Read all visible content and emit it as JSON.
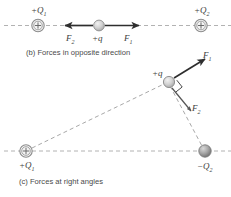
{
  "figure": {
    "panels": [
      {
        "id": "panel-b",
        "caption": "(b) Forces in opposite direction",
        "charges": [
          {
            "name": "charge-q1-top",
            "label": "+Q",
            "sub": "1",
            "kind": "positive-ring"
          },
          {
            "name": "charge-q-test-top",
            "label": "+q",
            "sub": "",
            "kind": "neutral-sphere"
          },
          {
            "name": "charge-q2-top",
            "label": "+Q",
            "sub": "2",
            "kind": "positive-ring"
          }
        ],
        "forces": [
          {
            "name": "force-f2-top",
            "label": "F",
            "sub": "2",
            "direction": "left"
          },
          {
            "name": "force-f1-top",
            "label": "F",
            "sub": "1",
            "direction": "right"
          }
        ]
      },
      {
        "id": "panel-c",
        "caption": "(c) Forces at right angles",
        "charges": [
          {
            "name": "charge-q1-bottom",
            "label": "+Q",
            "sub": "1",
            "kind": "positive-ring"
          },
          {
            "name": "charge-q-test-bottom",
            "label": "+q",
            "sub": "",
            "kind": "neutral-sphere"
          },
          {
            "name": "charge-q2-bottom",
            "label": "−Q",
            "sub": "2",
            "kind": "negative-sphere"
          }
        ],
        "forces": [
          {
            "name": "force-f1-bottom",
            "label": "F",
            "sub": "1",
            "direction": "up-right"
          },
          {
            "name": "force-f2-bottom",
            "label": "F",
            "sub": "2",
            "direction": "down-right"
          }
        ],
        "annotations": [
          {
            "name": "right-angle-marker",
            "label": "90 degree angle between F1 and F2"
          }
        ]
      }
    ],
    "colors": {
      "line": "#2e2e2e",
      "dash": "#b2b2b2",
      "charge_outline": "#8c8c8c",
      "sphere_fill": "#b9b9b9",
      "text": "#3d3d3d"
    }
  }
}
